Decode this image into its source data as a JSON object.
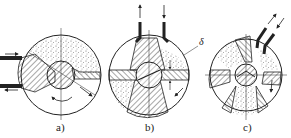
{
  "figure": {
    "panels": [
      {
        "id": "a",
        "label": "a)",
        "description": "disc with two inlet pipes on the left, hatched wedge, stippled upper region, central rotor"
      },
      {
        "id": "b",
        "label": "b)",
        "description": "disc with two vertical pipes on top (in/out arrows), hatched horizontal band, stippled sectors"
      },
      {
        "id": "c",
        "label": "c)",
        "description": "disc with two diagonal pipes at top-right, multiple alternating hatched/stippled sectors"
      }
    ],
    "annotation": {
      "symbol": "δ"
    },
    "colors": {
      "ink": "#222222",
      "background": "#ffffff",
      "stipple": "#555555"
    }
  }
}
